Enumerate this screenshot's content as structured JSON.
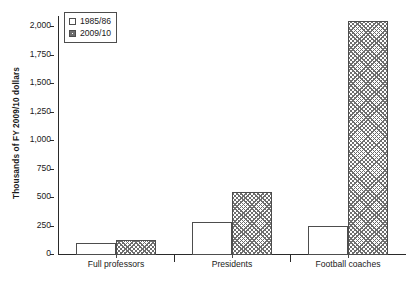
{
  "chart_data": {
    "type": "bar",
    "title": "",
    "xlabel": "",
    "ylabel": "Thousands of FY 2009/10 dollars",
    "categories": [
      "Full professors",
      "Presidents",
      "Football coaches"
    ],
    "series": [
      {
        "name": "1985/86",
        "values": [
          103,
          292,
          258
        ],
        "marker": "open-square"
      },
      {
        "name": "2009/10",
        "values": [
          129,
          558,
          2052
        ],
        "marker": "hatched-square"
      }
    ],
    "ylim": [
      0,
      2100
    ],
    "yticks": [
      0,
      250,
      500,
      750,
      1000,
      1250,
      1500,
      1750,
      2000
    ],
    "ytick_labels": [
      "0",
      "250",
      "500",
      "750",
      "1,000",
      "1,250",
      "1,500",
      "1,750",
      "2,000"
    ],
    "grid": false,
    "legend_position": "top-left",
    "colors": {
      "axis": "#2a2a2a",
      "bar_outline": "#4d4d4d",
      "series_a_fill": "#ffffff",
      "series_b_fill": "#6e6e6e",
      "background": "#ffffff"
    }
  },
  "legend": {
    "entries": [
      {
        "label": "1985/86"
      },
      {
        "label": "2009/10"
      }
    ]
  }
}
